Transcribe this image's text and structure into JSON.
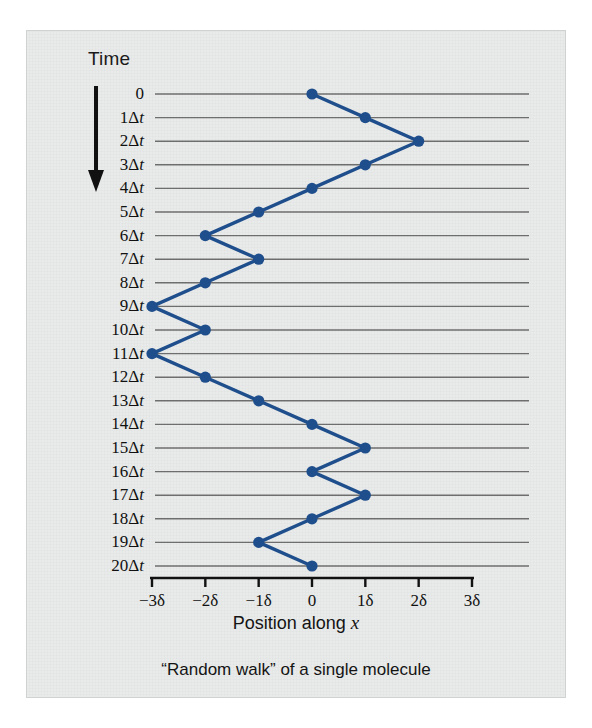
{
  "figure": {
    "time_axis_header": "Time",
    "x_axis_title_prefix": "Position along ",
    "x_axis_title_var": "x",
    "caption": "“Random walk” of a single molecule",
    "panel_background_color": "#e9ebea",
    "series_color": "#1f4e8c",
    "gridline_color": "#6e6e6e",
    "axis_color": "#111111",
    "arrow_icon_name": "time-direction-arrow"
  },
  "y_axis": {
    "labels": [
      "0",
      "1Δt",
      "2Δt",
      "3Δt",
      "4Δt",
      "5Δt",
      "6Δt",
      "7Δt",
      "8Δt",
      "9Δt",
      "10Δt",
      "11Δt",
      "12Δt",
      "13Δt",
      "14Δt",
      "15Δt",
      "16Δt",
      "17Δt",
      "18Δt",
      "19Δt",
      "20Δt"
    ]
  },
  "x_axis": {
    "tick_labels": [
      "−3δ",
      "−2δ",
      "−1δ",
      "0",
      "1δ",
      "2δ",
      "3δ"
    ],
    "tick_values": [
      -3,
      -2,
      -1,
      0,
      1,
      2,
      3
    ]
  },
  "chart_data": {
    "type": "line",
    "title": "“Random walk” of a single molecule",
    "xlabel": "Position along x",
    "ylabel": "Time",
    "xlim": [
      -3,
      3
    ],
    "ylim": [
      0,
      20
    ],
    "grid": true,
    "legend": "none",
    "x_unit": "δ",
    "y_unit": "Δt",
    "x_tick_labels": [
      "−3δ",
      "−2δ",
      "−1δ",
      "0",
      "1δ",
      "2δ",
      "3δ"
    ],
    "x_ticks": [
      -3,
      -2,
      -1,
      0,
      1,
      2,
      3
    ],
    "y_tick_labels": [
      "0",
      "1Δt",
      "2Δt",
      "3Δt",
      "4Δt",
      "5Δt",
      "6Δt",
      "7Δt",
      "8Δt",
      "9Δt",
      "10Δt",
      "11Δt",
      "12Δt",
      "13Δt",
      "14Δt",
      "15Δt",
      "16Δt",
      "17Δt",
      "18Δt",
      "19Δt",
      "20Δt"
    ],
    "y_ticks": [
      0,
      1,
      2,
      3,
      4,
      5,
      6,
      7,
      8,
      9,
      10,
      11,
      12,
      13,
      14,
      15,
      16,
      17,
      18,
      19,
      20
    ],
    "series": [
      {
        "name": "single molecule position",
        "color": "#1f4e8c",
        "marker": "circle",
        "t": [
          0,
          1,
          2,
          3,
          4,
          5,
          6,
          7,
          8,
          9,
          10,
          11,
          12,
          13,
          14,
          15,
          16,
          17,
          18,
          19,
          20
        ],
        "x": [
          0,
          1,
          2,
          1,
          0,
          -1,
          -2,
          -1,
          -2,
          -3,
          -2,
          -3,
          -2,
          -1,
          0,
          1,
          0,
          1,
          0,
          -1,
          0
        ]
      }
    ]
  }
}
